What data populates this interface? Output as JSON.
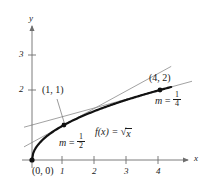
{
  "chart_data": {
    "type": "line",
    "title": "",
    "xlabel": "x",
    "ylabel": "y",
    "function_label": "f(x) = √x",
    "function_expression": "sqrt(x)",
    "xlim": [
      -0.25,
      5.0
    ],
    "ylim": [
      -0.35,
      3.6
    ],
    "grid": false,
    "legend": "none",
    "x_ticks": [
      "1",
      "2",
      "3",
      "4"
    ],
    "x_tick_values": [
      1,
      2,
      3,
      4
    ],
    "y_ticks": [
      "2",
      "3"
    ],
    "y_tick_values": [
      2,
      3
    ],
    "curve": {
      "name": "f(x) = sqrt(x)",
      "color": "#111111",
      "x": [
        0,
        0.05,
        0.1,
        0.2,
        0.3,
        0.5,
        0.75,
        1,
        1.5,
        2,
        2.5,
        3,
        3.5,
        4,
        4.35
      ],
      "y": [
        0,
        0.2236,
        0.3162,
        0.4472,
        0.5477,
        0.7071,
        0.866,
        1,
        1.2247,
        1.4142,
        1.5811,
        1.7321,
        1.8708,
        2,
        2.0857
      ]
    },
    "points": [
      {
        "label": "(0, 0)",
        "x": 0,
        "y": 0,
        "marked": true
      },
      {
        "label": "(1, 1)",
        "x": 1,
        "y": 1,
        "marked": true
      },
      {
        "label": "(4, 2)",
        "x": 4,
        "y": 2,
        "marked": true
      }
    ],
    "tangents": [
      {
        "at_point": "(1, 1)",
        "slope": 0.5,
        "slope_label_m": "m",
        "slope_label_eq": "=",
        "slope_numerator": "1",
        "slope_denominator": "2",
        "color": "#8a8a8a",
        "x_from": -0.25,
        "x_to": 4.35
      },
      {
        "at_point": "(4, 2)",
        "slope": 0.25,
        "slope_label_m": "m",
        "slope_label_eq": "=",
        "slope_numerator": "1",
        "slope_denominator": "4",
        "color": "#8a8a8a",
        "x_from": -0.25,
        "x_to": 5.0
      }
    ],
    "annotations": {
      "origin_label": "(0, 0)",
      "point1_label": "(1, 1)",
      "point2_label": "(4, 2)",
      "function_text_f": "f(x)",
      "function_text_eq": "=",
      "function_text_radical": "x"
    },
    "axis_color": "#6e6e6e",
    "curve_color": "#111111",
    "tangent_color": "#8a8a8a"
  }
}
